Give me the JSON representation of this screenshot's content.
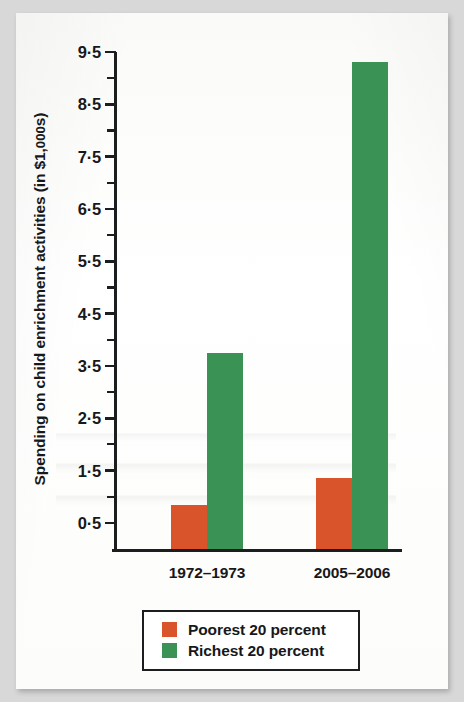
{
  "figure": {
    "y_axis_title_main": "Spending on child enrichment activities (in $1,",
    "y_axis_title_smallcap": "000",
    "y_axis_title_tail": "s)"
  },
  "legend": {
    "items": [
      {
        "label": "Poorest 20 percent",
        "color": "#d9542b",
        "swatch": "legend-swatch-poorest"
      },
      {
        "label": "Richest 20 percent",
        "color": "#3a9354",
        "swatch": "legend-swatch-richest"
      }
    ]
  },
  "chart_data": {
    "type": "bar",
    "title": "",
    "subtitle": "",
    "xlabel": "",
    "ylabel": "Spending on child enrichment activities (in $1,000s)",
    "categories": [
      "1972–1973",
      "2005–2006"
    ],
    "series": [
      {
        "name": "Poorest 20 percent",
        "color": "#d9542b",
        "values": [
          0.85,
          1.35
        ]
      },
      {
        "name": "Richest 20 percent",
        "color": "#3a9354",
        "values": [
          3.75,
          9.3
        ]
      }
    ],
    "ylim": [
      0,
      9.5
    ],
    "y_major_ticks": [
      0.5,
      1.5,
      2.5,
      3.5,
      4.5,
      5.5,
      6.5,
      7.5,
      8.5,
      9.5
    ],
    "y_major_tick_labels": [
      "0.5",
      "1.5",
      "2.5",
      "3.5",
      "4.5",
      "5.5",
      "6.5",
      "7.5",
      "8.5",
      "9.5"
    ],
    "y_minor_ticks": [
      0,
      1,
      2,
      3,
      4,
      5,
      6,
      7,
      8,
      9
    ],
    "grid": false,
    "legend_position": "bottom",
    "annotations": []
  }
}
